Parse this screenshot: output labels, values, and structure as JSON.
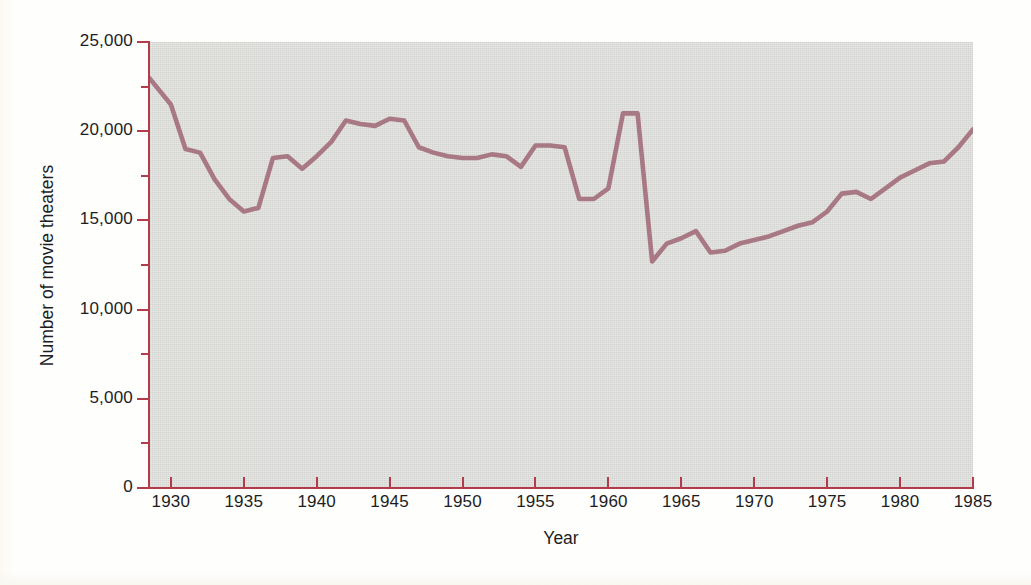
{
  "chart_data": {
    "type": "line",
    "title": "",
    "xlabel": "Year",
    "ylabel": "Number of movie theaters",
    "xlim": [
      1928.5,
      1985
    ],
    "ylim": [
      0,
      25000
    ],
    "grid": false,
    "legend": "none",
    "line_color": "#a87884",
    "axis_color": "#b23c4c",
    "plot_background": "#dcdcd9",
    "x_ticks": [
      "1930",
      "1935",
      "1940",
      "1945",
      "1950",
      "1955",
      "1960",
      "1965",
      "1970",
      "1975",
      "1980",
      "1985"
    ],
    "x_tick_values": [
      1930,
      1935,
      1940,
      1945,
      1950,
      1955,
      1960,
      1965,
      1970,
      1975,
      1980,
      1985
    ],
    "y_ticks": [
      "0",
      "5,000",
      "10,000",
      "15,000",
      "20,000",
      "25,000"
    ],
    "y_tick_values": [
      0,
      5000,
      10000,
      15000,
      20000,
      25000
    ],
    "y_minor_tick_values": [
      2500,
      7500,
      12500,
      17500,
      22500
    ],
    "series": [
      {
        "name": "Number of movie theaters",
        "x": [
          1928.5,
          1930,
          1931,
          1932,
          1933,
          1934,
          1935,
          1936,
          1937,
          1938,
          1939,
          1940,
          1941,
          1942,
          1943,
          1944,
          1945,
          1946,
          1947,
          1948,
          1949,
          1950,
          1951,
          1952,
          1953,
          1954,
          1955,
          1956,
          1957,
          1958,
          1959,
          1960,
          1961,
          1962,
          1963,
          1964,
          1965,
          1966,
          1967,
          1968,
          1969,
          1970,
          1971,
          1972,
          1973,
          1974,
          1975,
          1976,
          1977,
          1978,
          1979,
          1980,
          1981,
          1982,
          1983,
          1984,
          1985
        ],
        "values": [
          23000,
          21500,
          19000,
          18800,
          17300,
          16200,
          15500,
          15700,
          18500,
          18600,
          17900,
          18600,
          19400,
          20600,
          20400,
          20300,
          20700,
          20600,
          19100,
          18800,
          18600,
          18500,
          18500,
          18700,
          18600,
          18000,
          19200,
          19200,
          19100,
          16200,
          16200,
          16800,
          21000,
          21000,
          12700,
          13700,
          14000,
          14400,
          13200,
          13300,
          13700,
          13900,
          14100,
          14400,
          14700,
          14900,
          15500,
          16500,
          16600,
          16200,
          16800,
          17400,
          17800,
          18200,
          18300,
          19100,
          20100
        ]
      }
    ],
    "notes": {
      "start_value": "23,000",
      "depression_low": "15,500 (1935)",
      "peak": "21,000 (1961-1962)",
      "crash_low": "12,700 (1963)",
      "end_value": "20,100 (1985)"
    }
  },
  "axis_titles": {
    "x": "Year",
    "y": "Number of movie theaters"
  }
}
